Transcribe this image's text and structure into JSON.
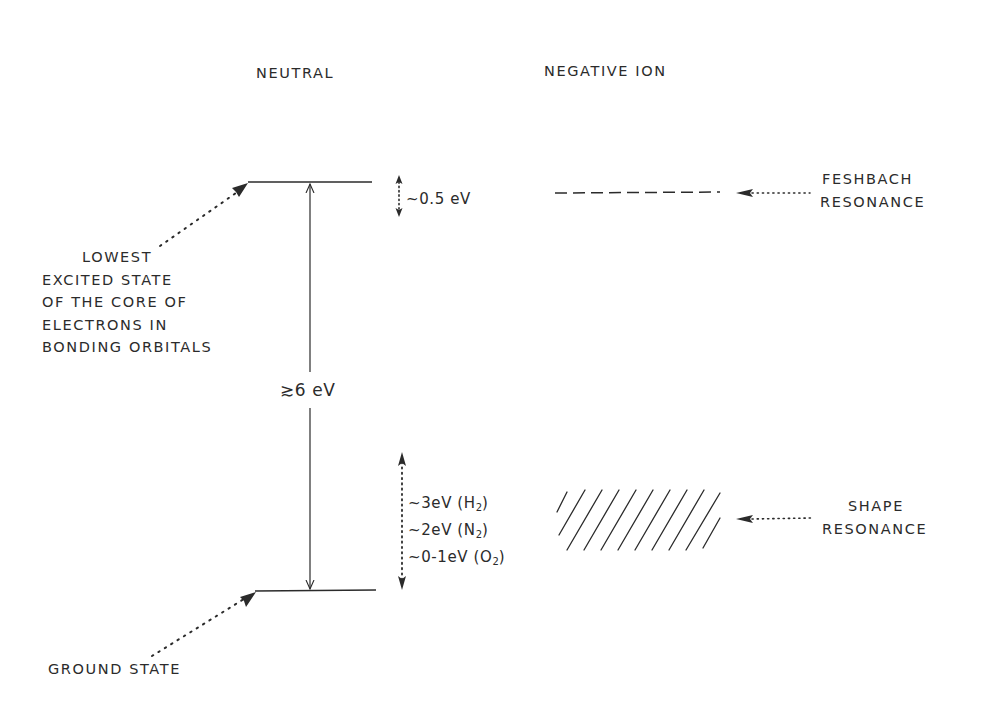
{
  "headers": {
    "neutral": "NEUTRAL",
    "negative_ion": "NEGATIVE ION"
  },
  "levels": {
    "excited_state_label": [
      "LOWEST",
      "EXCITED STATE",
      "OF THE CORE OF",
      "ELECTRONS IN",
      "BONDING ORBITALS"
    ],
    "ground_state_label": "GROUND STATE",
    "gap_label": "≳6 eV"
  },
  "feshbach": {
    "offset_label": "~0.5 eV",
    "label_line1": "FESHBACH",
    "label_line2": "RESONANCE"
  },
  "shape": {
    "energies": [
      {
        "text": "~3eV (H",
        "sub": "2",
        "close": ")"
      },
      {
        "text": "~2eV (N",
        "sub": "2",
        "close": ")"
      },
      {
        "text": "~0-1eV (O",
        "sub": "2",
        "close": ")"
      }
    ],
    "label_line1": "SHAPE",
    "label_line2": "RESONANCE"
  },
  "colors": {
    "ink": "#2b2b2b",
    "background": "#ffffff"
  }
}
